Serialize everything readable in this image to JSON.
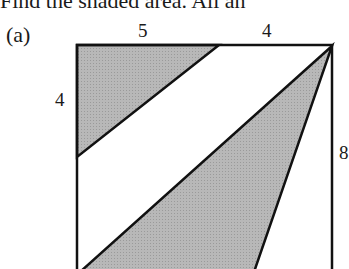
{
  "header": {
    "text": "Find the shaded area. All an"
  },
  "problem": {
    "part_label": "(a)",
    "labels": {
      "top_left_segment": "5",
      "top_right_segment": "4",
      "left_segment": "4",
      "right_side": "8"
    },
    "colors": {
      "shade": "#b4b4b4",
      "stroke": "#111111"
    }
  }
}
